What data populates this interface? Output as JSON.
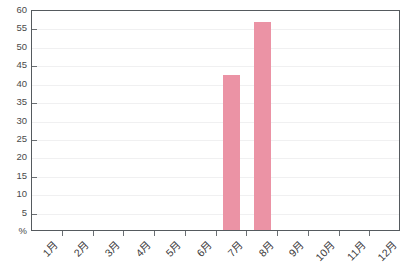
{
  "chart_data": {
    "type": "bar",
    "title": "",
    "subtitle": "",
    "xlabel": "",
    "ylabel": "%",
    "categories": [
      "1月",
      "2月",
      "3月",
      "4月",
      "5月",
      "6月",
      "7月",
      "8月",
      "9月",
      "10月",
      "11月",
      "12月"
    ],
    "values": [
      0,
      0,
      0,
      0,
      0,
      0,
      42,
      56.5,
      0,
      0,
      0,
      0
    ],
    "ylim": [
      0,
      60
    ],
    "ytick_values": [
      0,
      5,
      10,
      15,
      20,
      25,
      30,
      35,
      40,
      45,
      50,
      55,
      60
    ],
    "ytick_labels": [
      "%",
      "5",
      "10",
      "15",
      "20",
      "25",
      "30",
      "35",
      "40",
      "45",
      "50",
      "55",
      "60"
    ],
    "grid": true,
    "grid_axis": "y",
    "legend": false,
    "legend_position": "none",
    "bar_color": "#eb93a5",
    "grid_color": "#f0f0f1",
    "axis_color": "#555a5e",
    "text_color": "#3a3a3a",
    "background_color": "#ffffff"
  }
}
